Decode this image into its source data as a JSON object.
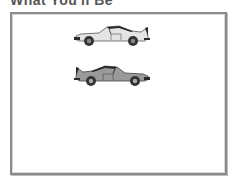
{
  "heading": {
    "text": "What You'll Be"
  },
  "canvas": {
    "cars": [
      {
        "id": "car-1",
        "body_color": "#e4e4e4",
        "roof_color": "#2a2a2a",
        "facing": "left"
      },
      {
        "id": "car-2",
        "body_color": "#9a9a9a",
        "roof_color": "#2a2a2a",
        "facing": "right"
      }
    ]
  },
  "colors": {
    "frame_border": "#8a8a8a",
    "background": "#ffffff",
    "wheel": "#333333"
  }
}
